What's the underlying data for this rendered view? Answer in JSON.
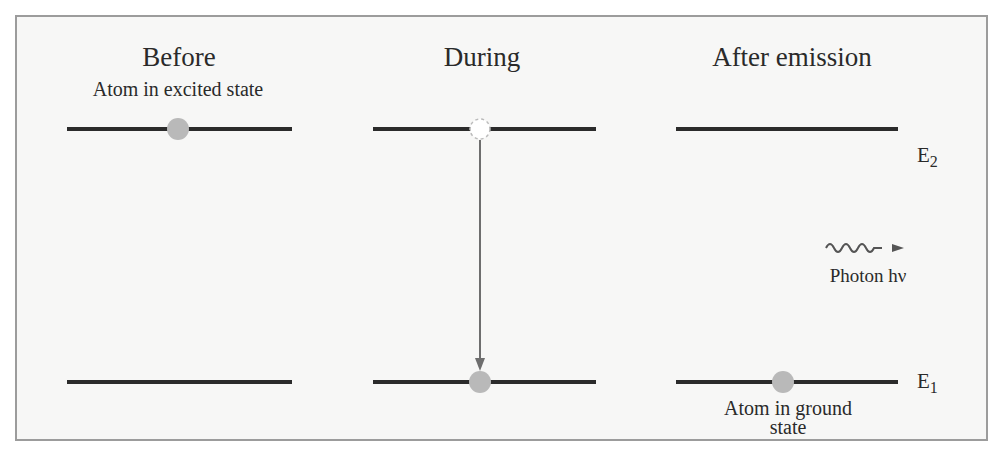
{
  "diagram": {
    "columns": [
      {
        "id": "before",
        "title": "Before",
        "caption": "Atom in excited state"
      },
      {
        "id": "during",
        "title": "During"
      },
      {
        "id": "after",
        "title": "After emission",
        "caption_line1": "Atom in ground",
        "caption_line2": "state"
      }
    ],
    "levels": {
      "upper": {
        "label": "E",
        "subscript": "2"
      },
      "lower": {
        "label": "E",
        "subscript": "1"
      }
    },
    "photon": {
      "label": "Photon hν"
    },
    "colors": {
      "line": "#2b2b2b",
      "atom": "#b9b9b9",
      "arrow": "#6e6e6e",
      "border": "#9c9c9c",
      "background": "#f7f7f6"
    }
  }
}
